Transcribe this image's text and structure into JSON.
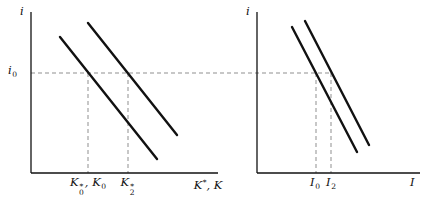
{
  "figure": {
    "background": "#ffffff",
    "ink_color": "#111111",
    "dash_color": "#8f8f8f"
  },
  "left_panel": {
    "y_axis_label": "i",
    "rate_label_base": "i",
    "rate_label_sub": "0",
    "tick1_base": "K",
    "tick1_sup": "*",
    "tick1_sub": "0",
    "tick1_tail_base": ", K",
    "tick1_tail_sub": "0",
    "tick2_base": "K",
    "tick2_sup": "*",
    "tick2_sub": "2",
    "x_axis_base": "K",
    "x_axis_sup": "*",
    "x_axis_tail": ", K"
  },
  "right_panel": {
    "y_axis_label": "i",
    "tick1_base": "I",
    "tick1_sub": "0",
    "tick2_base": "I",
    "tick2_sub": "2",
    "x_axis_label": "I"
  }
}
